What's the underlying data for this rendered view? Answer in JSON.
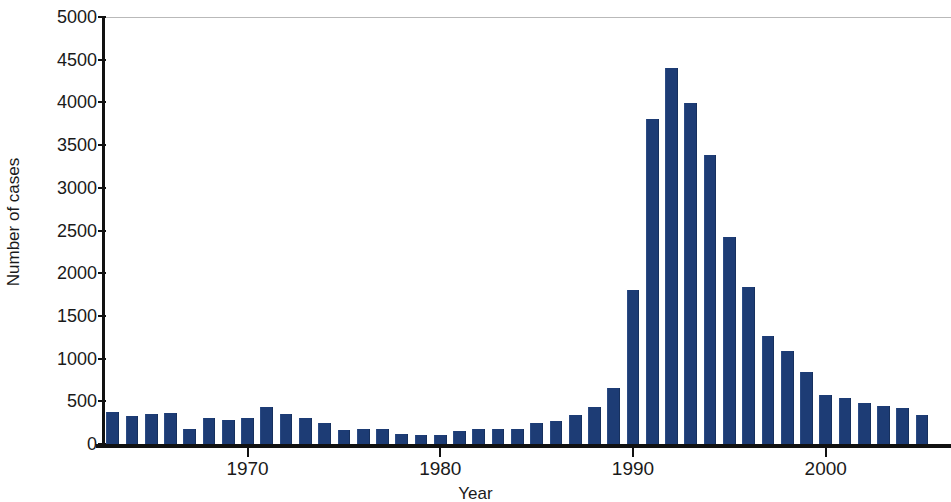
{
  "chart_data": {
    "type": "bar",
    "title": "",
    "xlabel": "Year",
    "ylabel": "Number of cases",
    "ylim": [
      0,
      5000
    ],
    "xlim": [
      1962.5,
      2006.5
    ],
    "grid": false,
    "legend": null,
    "bar_color": "#1d3c75",
    "y_ticks": [
      0,
      500,
      1000,
      1500,
      2000,
      2500,
      3000,
      3500,
      4000,
      4500,
      5000
    ],
    "y_tick_labels": [
      "0",
      "500",
      "1000",
      "1500",
      "2000",
      "2500",
      "3000",
      "3500",
      "4000",
      "4500",
      "5000"
    ],
    "x_ticks": [
      1970,
      1980,
      1990,
      2000
    ],
    "x_tick_labels": [
      "1970",
      "1980",
      "1990",
      "2000"
    ],
    "categories": [
      "1963",
      "1964",
      "1965",
      "1966",
      "1967",
      "1968",
      "1969",
      "1970",
      "1971",
      "1972",
      "1973",
      "1974",
      "1975",
      "1976",
      "1977",
      "1978",
      "1979",
      "1980",
      "1981",
      "1982",
      "1983",
      "1984",
      "1985",
      "1986",
      "1987",
      "1988",
      "1989",
      "1990",
      "1991",
      "1992",
      "1993",
      "1994",
      "1995",
      "1996",
      "1997",
      "1998",
      "1999",
      "2000",
      "2001",
      "2002",
      "2003",
      "2004",
      "2005"
    ],
    "values": [
      370,
      330,
      350,
      360,
      170,
      300,
      280,
      300,
      430,
      350,
      310,
      250,
      160,
      180,
      180,
      120,
      110,
      110,
      150,
      170,
      170,
      180,
      250,
      270,
      340,
      430,
      660,
      1800,
      3810,
      4400,
      3990,
      3390,
      2420,
      1840,
      1270,
      1090,
      840,
      570,
      540,
      480,
      440,
      420,
      340
    ]
  }
}
